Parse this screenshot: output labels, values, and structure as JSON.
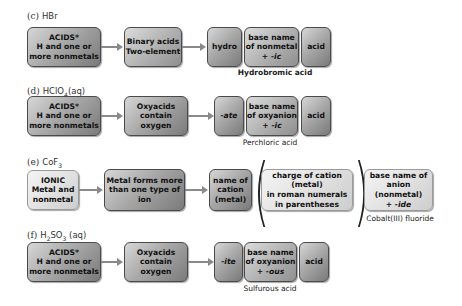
{
  "rows": [
    {
      "id": "c",
      "label_prefix": "(c)",
      "formula": "HBr",
      "start_box": [
        "ACIDS*",
        "H and one or",
        "more nonmetals"
      ],
      "category_box": [
        "Binary acids",
        "Two-element"
      ],
      "prefix_box": "hydro",
      "base_box": [
        "base name",
        "of nonmetal",
        "+ -ic"
      ],
      "suffix_box": "acid",
      "result": "Hydrobromic acid"
    },
    {
      "id": "d",
      "label_prefix": "(d)",
      "formula": "HClO4(aq)",
      "start_box": [
        "ACIDS*",
        "H and one or",
        "more nonmetals"
      ],
      "category_box": [
        "Oxyacids",
        "contain oxygen"
      ],
      "prefix_box": "-ate",
      "base_box": [
        "base name",
        "of oxyanion",
        "+ -ic"
      ],
      "suffix_box": "acid",
      "result": "Perchloric acid"
    },
    {
      "id": "e",
      "label_prefix": "(e)",
      "formula": "CoF3",
      "start_box": [
        "IONIC",
        "Metal and",
        "nonmetal"
      ],
      "category_box": [
        "Metal forms more",
        "than one type of ion"
      ],
      "cation_box": [
        "name of",
        "cation",
        "(metal)"
      ],
      "charge_box": [
        "charge of cation (metal)",
        "in roman numerals",
        "in parentheses"
      ],
      "anion_box": [
        "base name of",
        "anion (nonmetal)",
        "+ -ide"
      ],
      "result": "Cobalt(III) fluoride"
    },
    {
      "id": "f",
      "label_prefix": "(f)",
      "formula": "H2SO3 (aq)",
      "start_box": [
        "ACIDS*",
        "H and one or",
        "more nonmetals"
      ],
      "category_box": [
        "Oxyacids",
        "contain oxygen"
      ],
      "prefix_box": "-ite",
      "base_box": [
        "base name",
        "of oxyanion",
        "+ -ous"
      ],
      "suffix_box": "acid",
      "result": "Sulfurous acid"
    }
  ],
  "text": {
    "c_label": "(c)",
    "c_formula": "HBr",
    "d_label": "(d)",
    "d_formula_main": "HClO",
    "d_formula_sub": "4",
    "d_formula_tail": "(aq)",
    "e_label": "(e)",
    "e_formula_main": "CoF",
    "e_formula_sub": "3",
    "f_label": "(f)",
    "f_formula_h": "H",
    "f_formula_sub1": "2",
    "f_formula_so": "SO",
    "f_formula_sub2": "3",
    "f_formula_tail": " (aq)",
    "acids_l1": "ACIDS*",
    "acids_l2": "H and one or",
    "acids_l3": "more nonmetals",
    "binary_l1": "Binary acids",
    "binary_l2": "Two-element",
    "oxy_l1": "Oxyacids",
    "oxy_l2": "contain oxygen",
    "hydro": "hydro",
    "nonmetal_l1": "base name",
    "nonmetal_l2": "of nonmetal",
    "nonmetal_l3": "+ -ic",
    "acid": "acid",
    "ate": "-ate",
    "ite": "-ite",
    "oxyanion_l1": "base name",
    "oxyanion_l2": "of oxyanion",
    "plus": "+ ",
    "ic": "-ic",
    "ous": "-ous",
    "ionic_l1": "IONIC",
    "ionic_l2": "Metal and",
    "ionic_l3": "nonmetal",
    "metal_l1": "Metal forms more",
    "metal_l2": "than one type of ion",
    "cation_l1": "name of",
    "cation_l2": "cation",
    "cation_l3": "(metal)",
    "charge_l1": "charge of cation (metal)",
    "charge_l2": "in roman numerals",
    "charge_l3": "in parentheses",
    "anion_l1": "base name of",
    "anion_l2": "anion (nonmetal)",
    "ide": "-ide",
    "result_c": "Hydrobromic acid",
    "result_d": "Perchloric acid",
    "result_e": "Cobalt(III) fluoride",
    "result_f": "Sulfurous acid",
    "paren_open": "(",
    "paren_close": ")"
  }
}
